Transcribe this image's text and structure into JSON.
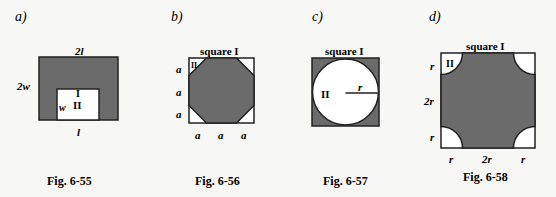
{
  "colors": {
    "shade": "#6b6b6b",
    "stroke": "#222222",
    "background": "#f7f7f5",
    "white": "#ffffff"
  },
  "figures": [
    {
      "panel": "a)",
      "caption": "Fig. 6-55",
      "labels": {
        "top": "2l",
        "left": "2w",
        "bottom": "l",
        "inner_side": "w",
        "region_I": "I",
        "region_II": "II"
      }
    },
    {
      "panel": "b)",
      "caption": "Fig. 6-56",
      "labels": {
        "title": "square I",
        "corner": "II",
        "left": [
          "a",
          "a",
          "a"
        ],
        "bottom": [
          "a",
          "a",
          "a"
        ]
      }
    },
    {
      "panel": "c)",
      "caption": "Fig. 6-57",
      "labels": {
        "title": "square I",
        "region_II": "II",
        "radius": "r"
      }
    },
    {
      "panel": "d)",
      "caption": "Fig. 6-58",
      "labels": {
        "title": "square I",
        "corner": "II",
        "left": [
          "r",
          "2r",
          "r"
        ],
        "bottom": [
          "r",
          "2r",
          "r"
        ]
      }
    }
  ]
}
